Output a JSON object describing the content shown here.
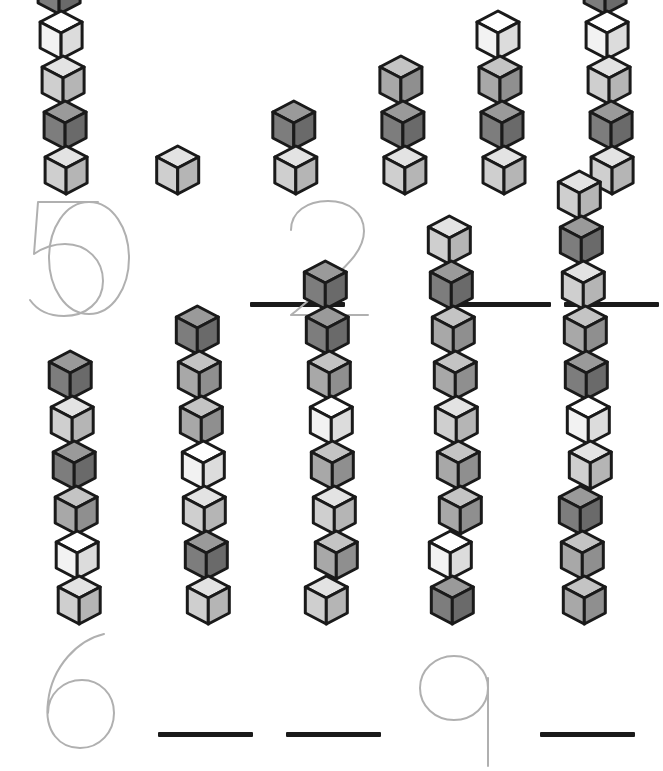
{
  "worksheet": {
    "title": "Counting Cubes Tracing Worksheet",
    "description": "Count the cubes in each tower, then trace or write the number below it.",
    "background_color": "#ffffff"
  },
  "palette": {
    "cube_outline": "#1a1a1a",
    "white_top": "#ffffff",
    "white_left": "#f2f2f2",
    "white_right": "#dcdcdc",
    "light_top": "#e3e3e3",
    "light_left": "#cfcfcf",
    "light_right": "#b5b5b5",
    "medium_top": "#c4c4c4",
    "medium_left": "#a8a8a8",
    "medium_right": "#8f8f8f",
    "dark_top": "#9a9a9a",
    "dark_left": "#7d7d7d",
    "dark_right": "#6a6a6a",
    "trace_stroke": "#b0b0b0",
    "write_line": "#1a1a1a"
  },
  "rows": [
    {
      "name": "top-row",
      "columns": [
        {
          "id": "col-1",
          "cube_count": 1,
          "answer_type": "trace",
          "answer_value": "0",
          "cubes": [
            "light"
          ]
        },
        {
          "id": "col-2",
          "cube_count": 2,
          "answer_type": "line",
          "answer_value": "",
          "cubes": [
            "dark",
            "light"
          ]
        },
        {
          "id": "col-3",
          "cube_count": 3,
          "answer_type": "trace",
          "answer_value": "2",
          "cubes": [
            "medium",
            "dark",
            "light"
          ]
        },
        {
          "id": "col-4",
          "cube_count": 4,
          "answer_type": "line",
          "answer_value": "",
          "cubes": [
            "white",
            "medium",
            "dark",
            "light"
          ]
        },
        {
          "id": "col-5",
          "cube_count": 5,
          "answer_type": "line",
          "answer_value": "",
          "cubes": [
            "dark",
            "white",
            "light",
            "dark",
            "light"
          ]
        },
        {
          "id": "col-6",
          "cube_count": 5,
          "answer_type": "trace",
          "answer_value": "5",
          "cubes": [
            "dark",
            "white",
            "light",
            "dark",
            "light"
          ]
        }
      ]
    },
    {
      "name": "bottom-row",
      "columns": [
        {
          "id": "col-7",
          "cube_count": 6,
          "answer_type": "trace",
          "answer_value": "6",
          "cubes": [
            "dark",
            "light",
            "dark",
            "medium",
            "white",
            "light"
          ]
        },
        {
          "id": "col-8",
          "cube_count": 7,
          "answer_type": "line",
          "answer_value": "",
          "cubes": [
            "dark",
            "medium",
            "medium",
            "white",
            "light",
            "dark",
            "light"
          ]
        },
        {
          "id": "col-9",
          "cube_count": 8,
          "answer_type": "line",
          "answer_value": "",
          "cubes": [
            "dark",
            "dark",
            "medium",
            "white",
            "medium",
            "light",
            "medium",
            "light"
          ]
        },
        {
          "id": "col-10",
          "cube_count": 9,
          "answer_type": "trace",
          "answer_value": "9",
          "cubes": [
            "light",
            "dark",
            "medium",
            "medium",
            "light",
            "medium",
            "medium",
            "white",
            "dark"
          ]
        },
        {
          "id": "col-11",
          "cube_count": 10,
          "answer_type": "line",
          "answer_value": "",
          "cubes": [
            "light",
            "dark",
            "light",
            "medium",
            "dark",
            "white",
            "light",
            "dark",
            "medium",
            "medium"
          ]
        }
      ]
    }
  ],
  "numeral_paths": {
    "0": "M 44 6 C 68 6 84 33 84 62 C 84 91 68 118 44 118 C 20 118 4 91 4 62 C 4 33 20 6 44 6 Z",
    "2": "M 7 34 C 7 16 23 5 44 5 C 65 5 80 17 80 35 C 80 55 62 70 42 89 C 26 104 14 113 7 119 L 84 119",
    "5": "M 80 6 L 20 6 L 16 58 C 26 51 36 48 47 48 C 69 48 85 64 85 85 C 85 106 68 120 46 120 C 31 120 19 114 12 104",
    "6": "M 74 8 C 48 14 22 40 18 76 C 14 106 30 122 50 122 C 70 122 84 106 84 87 C 84 68 70 54 52 54 C 33 54 18 68 18 87",
    "9": "M 78 62 C 78 80 63 94 44 94 C 25 94 10 80 10 62 C 10 44 25 30 44 30 C 63 30 78 44 78 62 Z M 78 52 L 78 140"
  },
  "columns_layout": {
    "top_row_left_positions": [
      14,
      145,
      276,
      407,
      527
    ],
    "bottom_row_left_positions": [
      14,
      145,
      276,
      407,
      527
    ]
  }
}
